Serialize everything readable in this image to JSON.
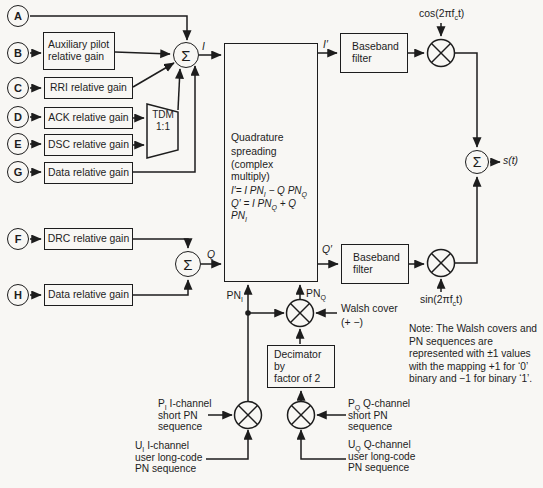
{
  "colors": {
    "ink": "#1d1d1d",
    "paper": "#f8f7f4"
  },
  "inputs": {
    "a": "A",
    "b": "B",
    "c": "C",
    "d": "D",
    "e": "E",
    "g": "G",
    "f": "F",
    "h": "H"
  },
  "gains": {
    "aux": {
      "l1": "Auxiliary pilot",
      "l2": "relative gain"
    },
    "rri": "RRI relative gain",
    "ack": "ACK relative gain",
    "dsc": "DSC relative gain",
    "data_i": "Data relative gain",
    "drc": "DRC relative gain",
    "data_q": "Data relative gain"
  },
  "tdm": {
    "l1": "TDM",
    "l2": "1:1"
  },
  "summer": "Σ",
  "signals": {
    "i": "I",
    "q": "Q",
    "i_prime": "I′",
    "q_prime": "Q′",
    "s_out": "s(t)"
  },
  "qs": {
    "l1": "Quadrature",
    "l2": "spreading",
    "l3": "(complex multiply)",
    "eq1": {
      "a": "I′= I PN",
      "s1": "I",
      "b": " − Q PN",
      "s2": "Q"
    },
    "eq2": {
      "a": "Q′ = I PN",
      "s1": "Q",
      "b": " + Q PN",
      "s2": "I"
    }
  },
  "bb": {
    "l1": "Baseband",
    "l2": "filter"
  },
  "carrier": {
    "cos_a": "cos(2πf",
    "cos_sub": "c",
    "cos_b": "t)",
    "sin_a": "sin(2πf",
    "sin_sub": "c",
    "sin_b": "t)"
  },
  "pn": {
    "i": {
      "a": "PN",
      "sub": "I"
    },
    "q": {
      "a": "PN",
      "sub": "Q"
    }
  },
  "walsh": {
    "l1": "Walsh cover",
    "l2": "(+ −)"
  },
  "decimator": {
    "l1": "Decimator by",
    "l2": "factor of 2"
  },
  "seq": {
    "pi": {
      "p": "P",
      "sub": "I",
      "l1": " I-channel",
      "l2": "short PN",
      "l3": "sequence"
    },
    "ui": {
      "p": "U",
      "sub": "I",
      "l1": " I-channel",
      "l2": "user long-code",
      "l3": "PN sequence"
    },
    "pq": {
      "p": "P",
      "sub": "Q",
      "l1": " Q-channel",
      "l2": "short PN",
      "l3": "sequence"
    },
    "uq": {
      "p": "U",
      "sub": "Q",
      "l1": " Q-channel",
      "l2": "user long-code",
      "l3": "PN sequence"
    }
  },
  "note": {
    "l1": "Note: The Walsh covers and",
    "l2": "PN sequences are",
    "l3": "represented with ±1 values",
    "l4": "with the mapping +1 for ‘0’",
    "l5": "binary and −1 for binary ‘1’."
  }
}
